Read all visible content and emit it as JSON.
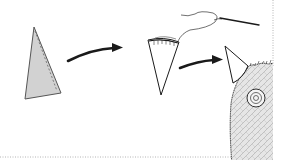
{
  "diagram": {
    "type": "craft-instruction-steps",
    "steps": [
      {
        "step": 1,
        "description": "triangle-fabric-piece",
        "fill": "#d2d2d2",
        "stitch": "dashed-seam"
      },
      {
        "step": 2,
        "description": "cone-with-gathered-top-and-threaded-needle"
      },
      {
        "step": 3,
        "description": "cone-sewn-onto-fuzzy-body"
      }
    ],
    "arrows": 2,
    "colors": {
      "line": "#1a1a1a",
      "fabric_fill": "#d2d2d2",
      "fur_fill": "#e4e4e4",
      "fur_pattern": "#9a9a9a",
      "border_dotted": "#b4b4b4",
      "background": "#ffffff"
    }
  }
}
